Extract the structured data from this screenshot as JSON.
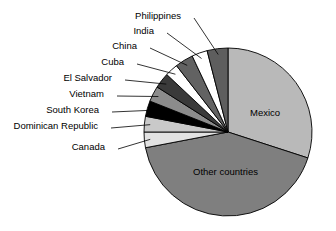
{
  "chart_data": {
    "type": "pie",
    "title": "",
    "subtitle": "",
    "xlabel": "",
    "ylabel": "",
    "legend_position": "none",
    "grid": false,
    "label_style": "callout-lines",
    "start_angle_deg": 90,
    "direction": "counterclockwise",
    "categories": [
      "Mexico",
      "Other countries",
      "Canada",
      "Dominican Republic",
      "South Korea",
      "Vietnam",
      "El Salvador",
      "Cuba",
      "China",
      "India",
      "Philippines"
    ],
    "values": [
      30.0,
      42.0,
      3.0,
      3.0,
      3.0,
      3.0,
      3.0,
      2.5,
      3.5,
      3.0,
      4.0
    ],
    "units": "percent",
    "slices": [
      {
        "label": "Mexico",
        "value": 30.0,
        "color": "#b9b9b9",
        "label_placement": "inside"
      },
      {
        "label": "Other countries",
        "value": 42.0,
        "color": "#7f7f7f",
        "label_placement": "inside"
      },
      {
        "label": "Canada",
        "value": 3.0,
        "color": "#e2e2e2",
        "label_placement": "callout"
      },
      {
        "label": "Dominican Republic",
        "value": 3.0,
        "color": "#c9c9c9",
        "label_placement": "callout"
      },
      {
        "label": "South Korea",
        "value": 3.0,
        "color": "#000000",
        "label_placement": "callout"
      },
      {
        "label": "Vietnam",
        "value": 3.0,
        "color": "#8c8c8c",
        "label_placement": "callout"
      },
      {
        "label": "El Salvador",
        "value": 3.0,
        "color": "#3a3a3a",
        "label_placement": "callout"
      },
      {
        "label": "Cuba",
        "value": 2.5,
        "color": "#ffffff",
        "label_placement": "callout"
      },
      {
        "label": "China",
        "value": 3.5,
        "color": "#626262",
        "label_placement": "callout"
      },
      {
        "label": "India",
        "value": 3.0,
        "color": "#ffffff",
        "label_placement": "callout"
      },
      {
        "label": "Philippines",
        "value": 4.0,
        "color": "#5e5e5e",
        "label_placement": "callout"
      }
    ]
  },
  "labels": {
    "philippines": "Philippines",
    "india": "India",
    "china": "China",
    "cuba": "Cuba",
    "el_salvador": "El Salvador",
    "vietnam": "Vietnam",
    "south_korea": "South Korea",
    "dominican_republic": "Dominican Republic",
    "canada": "Canada",
    "mexico": "Mexico",
    "other_countries": "Other countries"
  },
  "colors": {
    "background": "#ffffff",
    "outline": "#000000",
    "text": "#000000",
    "mexico": "#b9b9b9",
    "other_countries": "#7f7f7f",
    "canada": "#e2e2e2",
    "dominican_republic": "#c9c9c9",
    "south_korea": "#000000",
    "vietnam": "#8c8c8c",
    "el_salvador": "#3a3a3a",
    "cuba": "#ffffff",
    "china": "#626262",
    "india": "#ffffff",
    "philippines": "#5e5e5e"
  }
}
